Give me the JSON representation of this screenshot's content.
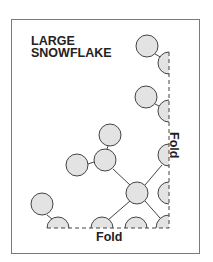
{
  "title": {
    "line1": "LARGE",
    "line2": "SNOWFLAKE"
  },
  "labels": {
    "fold_bottom": "Fold",
    "fold_right": "Fold"
  },
  "colors": {
    "circle_fill": "#e3e3e3",
    "stroke": "#444444",
    "frame": "#7a7a7a"
  }
}
